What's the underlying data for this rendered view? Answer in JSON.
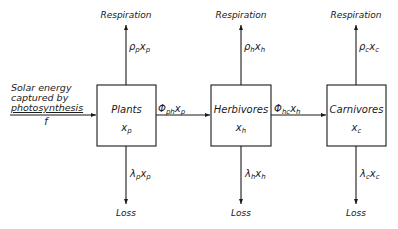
{
  "diagram": {
    "type": "flow-compartment",
    "colors": {
      "stroke": "#1a1a1a",
      "background": "#ffffff"
    },
    "input": {
      "label_lines": [
        "Solar energy",
        "captured by",
        "photosynthesis"
      ],
      "symbol": "f"
    },
    "nodes": [
      {
        "id": "plants",
        "title": "Plants",
        "state_var": "x",
        "state_sub": "p"
      },
      {
        "id": "herbivores",
        "title": "Herbivores",
        "state_var": "x",
        "state_sub": "h"
      },
      {
        "id": "carnivores",
        "title": "Carnivores",
        "state_var": "x",
        "state_sub": "c"
      }
    ],
    "respiration": [
      {
        "label": "Respiration",
        "coef": "ρ",
        "coef_sub": "p",
        "var": "x",
        "var_sub": "p"
      },
      {
        "label": "Respiration",
        "coef": "ρ",
        "coef_sub": "h",
        "var": "x",
        "var_sub": "h"
      },
      {
        "label": "Respiration",
        "coef": "ρ",
        "coef_sub": "c",
        "var": "x",
        "var_sub": "c"
      }
    ],
    "loss": [
      {
        "label": "Loss",
        "coef": "λ",
        "coef_sub": "p",
        "var": "x",
        "var_sub": "p"
      },
      {
        "label": "Loss",
        "coef": "λ",
        "coef_sub": "h",
        "var": "x",
        "var_sub": "h"
      },
      {
        "label": "Loss",
        "coef": "λ",
        "coef_sub": "c",
        "var": "x",
        "var_sub": "c"
      }
    ],
    "transfers": [
      {
        "from": "plants",
        "to": "herbivores",
        "coef": "Φ",
        "coef_sub": "ph",
        "var": "x",
        "var_sub": "p"
      },
      {
        "from": "herbivores",
        "to": "carnivores",
        "coef": "Φ",
        "coef_sub": "hc",
        "var": "x",
        "var_sub": "h"
      }
    ]
  }
}
